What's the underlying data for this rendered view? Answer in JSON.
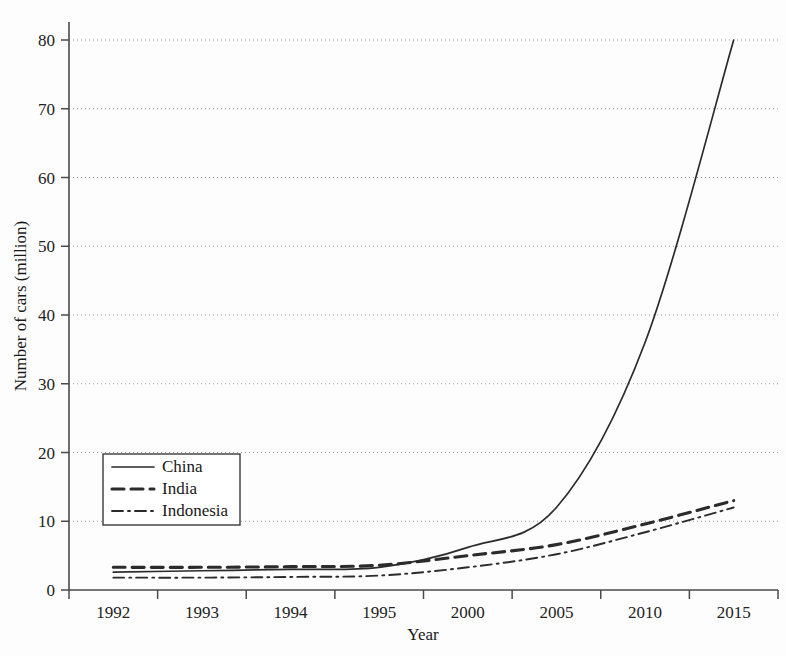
{
  "chart_data": {
    "type": "line",
    "title": "",
    "xlabel": "Year",
    "ylabel": "Number of cars (million)",
    "categories": [
      "1992",
      "1993",
      "1994",
      "1995",
      "2000",
      "2005",
      "2010",
      "2015"
    ],
    "xtick_labels": [
      "1992",
      "1993",
      "1994",
      "1995",
      "2000",
      "2005",
      "2010",
      "2015"
    ],
    "ytick_labels": [
      "0",
      "10",
      "20",
      "30",
      "40",
      "50",
      "60",
      "70",
      "80"
    ],
    "ytick_values": [
      0,
      10,
      20,
      30,
      40,
      50,
      60,
      70,
      80
    ],
    "ylim": [
      0,
      85
    ],
    "grid": "horizontal-dotted",
    "legend_position": "center-left",
    "axis_color": "#4a4a4a",
    "grid_color": "#9a9a9a",
    "line_color": "#2b2b2b",
    "series": [
      {
        "name": "China",
        "style": "solid",
        "values": [
          2.6,
          2.8,
          3.0,
          3.3,
          6.2,
          12.0,
          36.0,
          80.0
        ]
      },
      {
        "name": "India",
        "style": "dashed",
        "values": [
          3.3,
          3.3,
          3.4,
          3.6,
          5.0,
          6.6,
          9.6,
          13.0
        ]
      },
      {
        "name": "Indonesia",
        "style": "dash-dot",
        "values": [
          1.8,
          1.8,
          1.9,
          2.1,
          3.3,
          5.2,
          8.4,
          12.0
        ]
      }
    ]
  },
  "legend": {
    "entries": [
      {
        "label": "China"
      },
      {
        "label": "India"
      },
      {
        "label": "Indonesia"
      }
    ]
  }
}
